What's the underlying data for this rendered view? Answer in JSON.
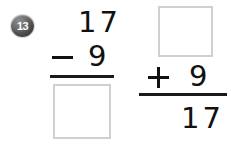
{
  "worksheet": {
    "question_number": "13",
    "background_color": "#ffffff",
    "ink_color": "#111111",
    "box_border_color": "#d0d0d0"
  },
  "problems": [
    {
      "id": "problem-left",
      "type": "subtraction",
      "minuend": "17",
      "operator": "−",
      "subtrahend": "9",
      "answer": "",
      "answer_is_blank": true
    },
    {
      "id": "problem-right",
      "type": "addition",
      "addend_top": "",
      "addend_top_is_blank": true,
      "operator": "+",
      "addend_bottom": "9",
      "sum": "17"
    }
  ]
}
